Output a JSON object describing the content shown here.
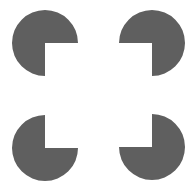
{
  "figure": {
    "background": "#ffffff",
    "fill": "#5f5f5f",
    "radius": 33,
    "shapes": [
      {
        "id": "top-left",
        "cx": 45,
        "cy": 43,
        "missing_quadrant": "bottom-right"
      },
      {
        "id": "top-right",
        "cx": 152,
        "cy": 43,
        "missing_quadrant": "bottom-left"
      },
      {
        "id": "bottom-left",
        "cx": 45,
        "cy": 148,
        "missing_quadrant": "top-right"
      },
      {
        "id": "bottom-right",
        "cx": 152,
        "cy": 147,
        "missing_quadrant": "top-left"
      }
    ]
  }
}
